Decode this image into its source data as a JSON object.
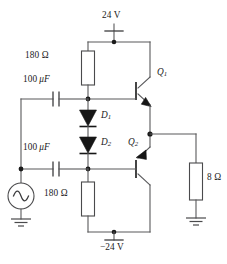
{
  "diagram": {
    "supplies": {
      "positive_label": "24 V",
      "negative_label": "−24 V"
    },
    "components": [
      {
        "id": "r-top",
        "name": "bias-resistor-top",
        "label": "180 Ω",
        "type": "resistor"
      },
      {
        "id": "r-bot",
        "name": "bias-resistor-bottom",
        "label": "180 Ω",
        "type": "resistor"
      },
      {
        "id": "c-top",
        "name": "coupling-capacitor-top",
        "label_value": "100",
        "label_unit": "μF",
        "type": "capacitor"
      },
      {
        "id": "c-bot",
        "name": "coupling-capacitor-bottom",
        "label_value": "100",
        "label_unit": "μF",
        "type": "capacitor"
      },
      {
        "id": "d1",
        "name": "bias-diode-1",
        "label_base": "D",
        "label_sub": "1",
        "type": "diode"
      },
      {
        "id": "d2",
        "name": "bias-diode-2",
        "label_base": "D",
        "label_sub": "2",
        "type": "diode"
      },
      {
        "id": "q1",
        "name": "transistor-q1",
        "label_base": "Q",
        "label_sub": "1",
        "type": "npn-transistor"
      },
      {
        "id": "q2",
        "name": "transistor-q2",
        "label_base": "Q",
        "label_sub": "2",
        "type": "pnp-transistor"
      },
      {
        "id": "r-load",
        "name": "load-resistor",
        "label": "8 Ω",
        "type": "resistor"
      },
      {
        "id": "vsrc",
        "name": "ac-source",
        "label": "",
        "type": "ac-voltage-source"
      }
    ],
    "labels": {
      "supply_positive": "24 V",
      "supply_negative": "−24 V",
      "resistor_top": "180 Ω",
      "resistor_bottom": "180 Ω",
      "capacitor_top_value": "100",
      "capacitor_top_unit": "μF",
      "capacitor_bottom_value": "100",
      "capacitor_bottom_unit": "μF",
      "diode_1_base": "D",
      "diode_1_sub": "1",
      "diode_2_base": "D",
      "diode_2_sub": "2",
      "transistor_1_base": "Q",
      "transistor_1_sub": "1",
      "transistor_2_base": "Q",
      "transistor_2_sub": "2",
      "load_resistor": "8 Ω"
    },
    "colors": {
      "wire": "#58585a",
      "wire_dark": "#3b3b3d",
      "fill_solid": "#161616",
      "background": "#ffffff",
      "text": "#1a1a1a"
    },
    "grounds": [
      {
        "name": "ground-source"
      },
      {
        "name": "ground-load"
      }
    ]
  }
}
